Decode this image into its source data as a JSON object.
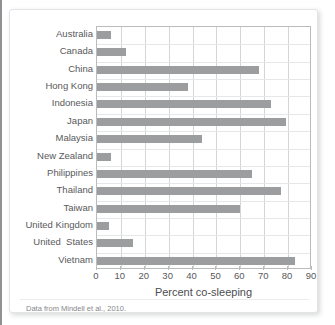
{
  "figure": {
    "caption": "Data from Mindell et al., 2010."
  },
  "chart_data": {
    "type": "bar",
    "orientation": "horizontal",
    "title": "",
    "xlabel": "Percent co-sleeping",
    "ylabel": "",
    "xlim": [
      0,
      90
    ],
    "xticks": [
      0,
      10,
      20,
      30,
      40,
      50,
      60,
      70,
      80,
      90
    ],
    "xtick_labels": [
      "0",
      "10",
      "20",
      "30",
      "40",
      "50",
      "60",
      "70",
      "80",
      "90"
    ],
    "grid": true,
    "legend": false,
    "bar_color": "#9b9d9f",
    "categories": [
      "Australia",
      "Canada",
      "China",
      "Hong Kong",
      "Indonesia",
      "Japan",
      "Malaysia",
      "New Zealand",
      "Philippines",
      "Thailand",
      "Taiwan",
      "United Kingdom",
      "United  States",
      "Vietnam"
    ],
    "values": [
      6,
      12,
      68,
      38,
      73,
      79,
      44,
      6,
      65,
      77,
      60,
      5,
      15,
      83
    ]
  }
}
